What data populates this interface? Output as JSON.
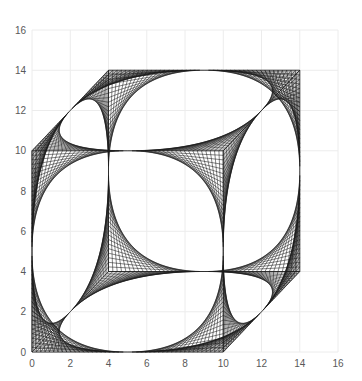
{
  "chart_data": {
    "type": "scatter",
    "title": "",
    "xlabel": "",
    "ylabel": "",
    "xlim": [
      0,
      16
    ],
    "ylim": [
      0,
      16
    ],
    "x_ticks": [
      0,
      2,
      4,
      6,
      8,
      10,
      12,
      14,
      16
    ],
    "y_ticks": [
      0,
      2,
      4,
      6,
      8,
      10,
      12,
      14,
      16
    ],
    "grid": true,
    "legend": null,
    "line_color": "#1a1a1a",
    "strings_per_corner": 22,
    "faces": [
      {
        "name": "front",
        "points": [
          [
            0,
            0
          ],
          [
            10,
            0
          ],
          [
            10,
            10
          ],
          [
            0,
            10
          ]
        ]
      },
      {
        "name": "back",
        "points": [
          [
            4,
            4
          ],
          [
            14,
            4
          ],
          [
            14,
            14
          ],
          [
            4,
            14
          ]
        ]
      },
      {
        "name": "top",
        "points": [
          [
            0,
            10
          ],
          [
            10,
            10
          ],
          [
            14,
            14
          ],
          [
            4,
            14
          ]
        ]
      },
      {
        "name": "bottom",
        "points": [
          [
            0,
            0
          ],
          [
            10,
            0
          ],
          [
            14,
            4
          ],
          [
            4,
            4
          ]
        ]
      },
      {
        "name": "left",
        "points": [
          [
            0,
            0
          ],
          [
            4,
            4
          ],
          [
            4,
            14
          ],
          [
            0,
            10
          ]
        ]
      },
      {
        "name": "right",
        "points": [
          [
            10,
            0
          ],
          [
            14,
            4
          ],
          [
            14,
            14
          ],
          [
            10,
            10
          ]
        ]
      }
    ],
    "edges": [
      [
        [
          0,
          0
        ],
        [
          0,
          10
        ]
      ],
      [
        [
          4,
          4
        ],
        [
          4,
          14
        ]
      ],
      [
        [
          10,
          10
        ],
        [
          14,
          14
        ]
      ],
      [
        [
          4,
          4
        ],
        [
          14,
          4
        ]
      ],
      [
        [
          10,
          0
        ],
        [
          10,
          10
        ]
      ]
    ]
  }
}
